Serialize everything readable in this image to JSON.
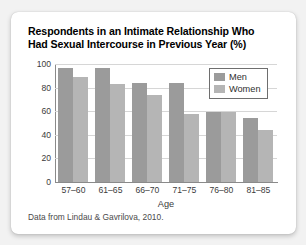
{
  "card": {
    "title_lines": [
      "Respondents in an Intimate Relationship Who",
      "Had Sexual Intercourse in Previous Year (%)"
    ],
    "source_note": "Data from Lindau & Gavrilova, 2010."
  },
  "colors": {
    "men_bar": "#9b9b9b",
    "women_bar": "#b5b5b5",
    "axis": "#8a8a8a",
    "gridline": "#d6d6d6",
    "card_background": "#ffffff",
    "page_background": "#f2f2f2",
    "text": "#000000"
  },
  "chart_data": {
    "type": "bar",
    "title": "Respondents in an Intimate Relationship Who Had Sexual Intercourse in Previous Year (%)",
    "xlabel": "Age",
    "ylabel": "",
    "categories": [
      "57–60",
      "61–65",
      "66–70",
      "71–75",
      "76–80",
      "81–85"
    ],
    "series": [
      {
        "name": "Men",
        "values": [
          97,
          97,
          84,
          84,
          59,
          54
        ]
      },
      {
        "name": "Women",
        "values": [
          89,
          83,
          74,
          58,
          59,
          44
        ]
      }
    ],
    "ylim": [
      0,
      100
    ],
    "yticks": [
      0,
      20,
      40,
      60,
      80,
      100
    ],
    "grid": "horizontal",
    "legend_position": "top-right",
    "annotations": [
      "Data from Lindau & Gavrilova, 2010."
    ]
  }
}
